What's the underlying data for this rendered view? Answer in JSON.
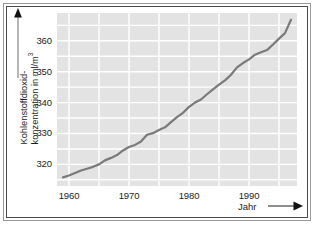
{
  "chart_data": {
    "type": "line",
    "title": "",
    "subtitle": "",
    "xlabel": "Jahr",
    "ylabel": "Kohlenstoffdioxid-\nkonzentration in ml/m",
    "ylabel_exponent": "3",
    "ylabel_full": "Kohlenstoffdioxid-konzentration in ml/m³",
    "xlim": [
      1958,
      1998
    ],
    "ylim": [
      313,
      369
    ],
    "xticks": [
      1960,
      1970,
      1980,
      1990
    ],
    "xtick_labels": [
      "1960",
      "1970",
      "1980",
      "1990"
    ],
    "yticks": [
      320,
      330,
      340,
      350,
      360
    ],
    "ytick_labels": [
      "320",
      "330",
      "340",
      "350",
      "360"
    ],
    "grid": true,
    "grid_color": "#ffffff",
    "grid_x_step": 5,
    "grid_y_step": 5,
    "plot_background": "#e3e3e3",
    "line_color": "#7a7a7a",
    "line_width": 2.2,
    "legend": null,
    "axis_arrows": true,
    "series": [
      {
        "name": "CO2-Konzentration",
        "x": [
          1959,
          1960,
          1961,
          1962,
          1963,
          1964,
          1965,
          1966,
          1967,
          1968,
          1969,
          1970,
          1971,
          1972,
          1973,
          1974,
          1975,
          1976,
          1977,
          1978,
          1979,
          1980,
          1981,
          1982,
          1983,
          1984,
          1985,
          1986,
          1987,
          1988,
          1989,
          1990,
          1991,
          1992,
          1993,
          1994,
          1995,
          1996,
          1997
        ],
        "values": [
          315.8,
          316.4,
          317.2,
          318.0,
          318.6,
          319.2,
          320.0,
          321.3,
          322.1,
          323.0,
          324.5,
          325.6,
          326.3,
          327.4,
          329.6,
          330.1,
          331.1,
          332.0,
          333.7,
          335.3,
          336.7,
          338.6,
          340.0,
          341.0,
          342.7,
          344.3,
          345.8,
          347.2,
          349.0,
          351.4,
          352.8,
          354.0,
          355.5,
          356.3,
          357.0,
          358.8,
          360.7,
          362.5,
          366.8
        ]
      }
    ]
  },
  "axes": {
    "y_arrow_name": "y-axis-arrow",
    "x_arrow_name": "x-axis-arrow"
  }
}
